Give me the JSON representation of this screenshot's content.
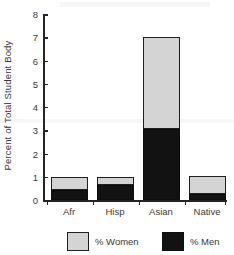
{
  "chart_data": {
    "type": "bar",
    "subtype": "stacked-vertical",
    "title": "",
    "xlabel": "",
    "ylabel": "Percent of Total Student Body",
    "categories": [
      "Afr",
      "Hisp",
      "Asian",
      "Native"
    ],
    "series": [
      {
        "name": "% Men",
        "color": "#121212",
        "values": [
          0.42,
          0.65,
          3.05,
          0.25
        ]
      },
      {
        "name": "% Women",
        "color": "#d4d4d4",
        "values": [
          0.58,
          0.35,
          3.95,
          0.78
        ]
      }
    ],
    "totals": [
      1.0,
      1.0,
      7.0,
      1.03
    ],
    "ylim": [
      0,
      8
    ],
    "ytick_labels": [
      "0",
      "1",
      "2",
      "3",
      "4",
      "5",
      "6",
      "7",
      "8"
    ],
    "ytick_values": [
      0,
      1,
      2,
      3,
      4,
      5,
      6,
      7,
      8
    ],
    "grid": false,
    "legend_position": "bottom"
  },
  "legend": {
    "women_label": "% Women",
    "men_label": "% Men"
  }
}
